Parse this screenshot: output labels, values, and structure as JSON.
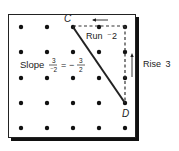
{
  "diagram": {
    "type": "geoboard-slope",
    "grid": {
      "rows": 5,
      "cols": 5
    },
    "points": {
      "C": {
        "label": "C",
        "col": 2,
        "row": 0
      },
      "D": {
        "label": "D",
        "col": 4,
        "row": 3
      }
    },
    "run": {
      "label": "Run",
      "value": "⁻2"
    },
    "rise": {
      "label": "Rise",
      "value": "3"
    },
    "slope": {
      "label": "Slope",
      "fraction1": {
        "num": "3",
        "den": "⁻2"
      },
      "equals": "=",
      "sign": "−",
      "fraction2": {
        "num": "3",
        "den": "2"
      }
    },
    "colors": {
      "ink": "#1a1a1a",
      "background": "#ffffff",
      "shadow": "#111111"
    }
  }
}
